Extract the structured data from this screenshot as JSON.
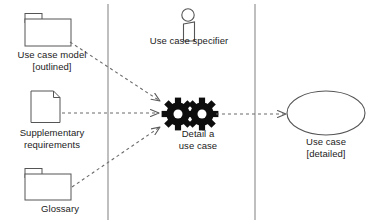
{
  "diagram": {
    "type": "uml-activity-workflow",
    "swimlane_dividers": [
      108,
      255
    ],
    "colors": {
      "stroke": "#555555",
      "text": "#1b1b1b",
      "gear_fill": "#0d0d0d",
      "background": "#ffffff",
      "dashed_arrow": "#6b6b6b"
    },
    "inputs": [
      {
        "id": "use-case-model",
        "icon": "folder-icon",
        "label": "Use case model\n[outlined]"
      },
      {
        "id": "supplementary-requirements",
        "icon": "document-icon",
        "label": "Supplementary\nrequirements"
      },
      {
        "id": "glossary",
        "icon": "folder-icon",
        "label": "Glossary"
      }
    ],
    "worker": {
      "id": "use-case-specifier",
      "icon": "actor-icon",
      "label": "Use case specifier"
    },
    "activity": {
      "id": "detail-a-use-case",
      "icon": "gears-icon",
      "label": "Detail a\nuse case"
    },
    "output": {
      "id": "use-case-detailed",
      "icon": "ellipse-icon",
      "label": "Use case\n[detailed]"
    },
    "connections": [
      {
        "from": "use-case-model",
        "to": "detail-a-use-case",
        "style": "dashed-arrow"
      },
      {
        "from": "supplementary-requirements",
        "to": "detail-a-use-case",
        "style": "dashed-arrow"
      },
      {
        "from": "glossary",
        "to": "detail-a-use-case",
        "style": "dashed-arrow"
      },
      {
        "from": "detail-a-use-case",
        "to": "use-case-detailed",
        "style": "dashed-arrow"
      }
    ]
  }
}
